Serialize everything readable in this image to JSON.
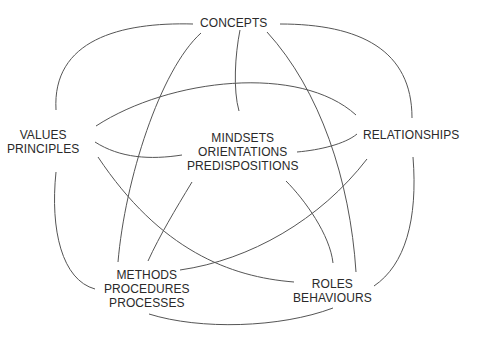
{
  "diagram": {
    "type": "concept-network",
    "nodes": [
      {
        "id": "concepts",
        "lines": [
          "CONCEPTS"
        ]
      },
      {
        "id": "values",
        "lines": [
          "VALUES",
          "PRINCIPLES"
        ]
      },
      {
        "id": "mindsets",
        "lines": [
          "MINDSETS",
          "ORIENTATIONS",
          "PREDISPOSITIONS"
        ]
      },
      {
        "id": "relationships",
        "lines": [
          "RELATIONSHIPS"
        ]
      },
      {
        "id": "methods",
        "lines": [
          "METHODS",
          "PROCEDURES",
          "PROCESSES"
        ]
      },
      {
        "id": "roles",
        "lines": [
          "ROLES",
          "BEHAVIOURS"
        ]
      }
    ],
    "edges": [
      [
        "concepts",
        "values"
      ],
      [
        "concepts",
        "methods"
      ],
      [
        "concepts",
        "mindsets"
      ],
      [
        "concepts",
        "roles"
      ],
      [
        "concepts",
        "relationships"
      ],
      [
        "values",
        "relationships"
      ],
      [
        "values",
        "mindsets"
      ],
      [
        "values",
        "roles"
      ],
      [
        "values",
        "methods"
      ],
      [
        "mindsets",
        "relationships"
      ],
      [
        "mindsets",
        "methods"
      ],
      [
        "mindsets",
        "roles"
      ],
      [
        "relationships",
        "methods"
      ],
      [
        "relationships",
        "roles"
      ],
      [
        "methods",
        "roles"
      ]
    ],
    "line_color": "#555555",
    "text_color": "#2a2a2a"
  }
}
